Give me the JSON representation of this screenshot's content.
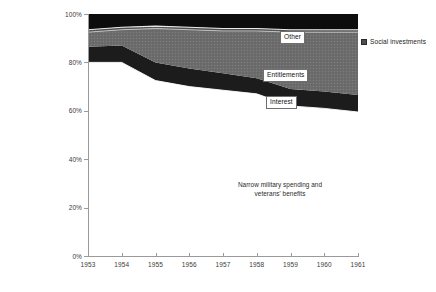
{
  "chart_data": {
    "type": "area",
    "stacked": "100%",
    "title": "",
    "subtitle": "",
    "xlabel": "",
    "ylabel": "",
    "x": [
      1953,
      1954,
      1955,
      1956,
      1957,
      1958,
      1959,
      1960,
      1961
    ],
    "categories": [
      "1953",
      "1954",
      "1955",
      "1956",
      "1957",
      "1958",
      "1959",
      "1960",
      "1961"
    ],
    "xlim": [
      1953,
      1961
    ],
    "ylim": [
      0,
      100
    ],
    "yticks": [
      0,
      20,
      40,
      60,
      80,
      100
    ],
    "ytick_labels": [
      "0%",
      "20%",
      "40%",
      "60%",
      "80%",
      "100%"
    ],
    "xtick_labels": [
      "1953",
      "1954",
      "1955",
      "1956",
      "1957",
      "1958",
      "1959",
      "1960",
      "1961"
    ],
    "grid": false,
    "legend_position": "right",
    "series": [
      {
        "name": "Narrow military spending and veterans' benefits",
        "label_in_plot": "Narrow military spending and veterans' benefits",
        "color": "#ffffff",
        "values": [
          80.0,
          80.0,
          72.5,
          70.0,
          68.5,
          67.0,
          62.0,
          61.0,
          59.5
        ]
      },
      {
        "name": "Interest",
        "label_in_plot": "Interest",
        "color": "#1c1c1c",
        "values": [
          6.5,
          7.0,
          7.5,
          7.5,
          7.0,
          6.5,
          7.0,
          7.0,
          7.0
        ]
      },
      {
        "name": "Entitlements",
        "label_in_plot": "Entitlements",
        "color": "#6a6a6a",
        "values": [
          6.0,
          6.5,
          14.0,
          16.0,
          17.5,
          19.5,
          23.5,
          24.5,
          26.0
        ]
      },
      {
        "name": "Social investments",
        "label_in_plot": "",
        "color": "#4f4f4f",
        "values": [
          1.0,
          1.0,
          1.0,
          1.0,
          1.0,
          1.0,
          1.0,
          1.0,
          1.0
        ]
      },
      {
        "name": "Other",
        "label_in_plot": "Other",
        "color": "#0d0d0d",
        "values": [
          6.5,
          5.5,
          5.0,
          5.5,
          6.0,
          6.0,
          6.5,
          6.5,
          6.5
        ]
      }
    ],
    "boundaries_pct": {
      "military_top": [
        80.0,
        80.0,
        72.5,
        70.0,
        68.5,
        67.0,
        62.0,
        61.0,
        59.5
      ],
      "interest_top": [
        86.5,
        87.0,
        80.0,
        77.5,
        75.5,
        73.5,
        69.0,
        68.0,
        66.5
      ],
      "entitlements_top": [
        92.5,
        93.5,
        94.0,
        93.5,
        93.0,
        93.0,
        92.5,
        92.5,
        92.5
      ],
      "social_top": [
        93.5,
        94.5,
        95.0,
        94.5,
        94.0,
        94.0,
        93.5,
        93.5,
        93.5
      ]
    }
  },
  "legend": {
    "items": [
      {
        "label": "Social investments",
        "color": "#4f4f4f"
      }
    ]
  },
  "annotations": {
    "other": "Other",
    "entitlements": "Entitlements",
    "interest": "Interest",
    "military_line1": "Narrow military spending and",
    "military_line2": "veterans' benefits"
  },
  "colors": {
    "axis": "#9a9a9a",
    "tick_text": "#3b3b3b",
    "band_other": "#0d0d0d",
    "band_social": "#4f4f4f",
    "band_entitlements": "#6a6a6a",
    "band_interest": "#1c1c1c",
    "band_military": "#ffffff",
    "background": "#ffffff"
  }
}
